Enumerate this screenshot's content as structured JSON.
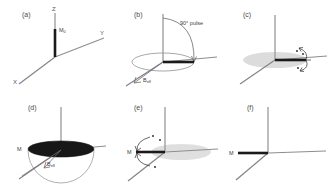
{
  "figure": {
    "width": 335,
    "height": 186,
    "background": "#ffffff"
  },
  "style": {
    "axis_color": "#8e8e92",
    "vector_color": "#1a1a1a",
    "disc_fill": "#171717",
    "shade_fill": "#d9d9d9",
    "label_color": "#4a4a4a"
  },
  "axes": {
    "z_label": "Z",
    "y_label": "Y",
    "x_label": "X"
  },
  "panels": [
    {
      "id": "a",
      "label": "(a)",
      "vector_label": "M",
      "vector_sub": "0",
      "description": "Equilibrium magnetization M0 aligned along +Z",
      "show_axis_labels": true
    },
    {
      "id": "b",
      "label": "(b)",
      "pulse_label": "90° pulse",
      "beff_label": "B",
      "beff_sub": "eff",
      "description": "90 degree pulse rotates magnetization from Z into the transverse plane"
    },
    {
      "id": "c",
      "label": "(c)",
      "description": "Transverse magnetization with precession indicated by curved arrows"
    },
    {
      "id": "d",
      "label": "(d)",
      "vector_label": "M",
      "beff_label": "B",
      "beff_sub": "eff",
      "description": "Magnetization M spread over a cone about the effective field Beff"
    },
    {
      "id": "e",
      "label": "(e)",
      "vector_label": "M",
      "description": "Refocusing of the magnetization vector M along the negative Y axis"
    },
    {
      "id": "f",
      "label": "(f)",
      "vector_label": "M",
      "description": "Refocused magnetization M aligned along the negative Y axis"
    }
  ]
}
